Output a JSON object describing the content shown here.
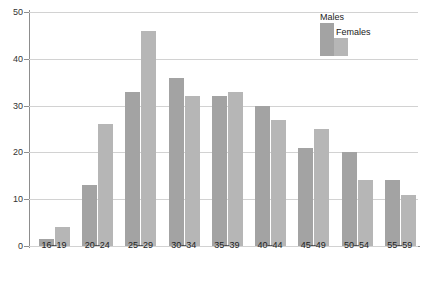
{
  "chart_data": {
    "type": "bar",
    "title": "",
    "subtitle": "",
    "xlabel": "",
    "ylabel": "",
    "categories": [
      "16–19",
      "20–24",
      "25–29",
      "30–34",
      "35–39",
      "40–44",
      "45–49",
      "50–54",
      "55–59"
    ],
    "series": [
      {
        "name": "Males",
        "color": "#a3a3a3",
        "values": [
          1.5,
          13,
          33,
          36,
          32,
          30,
          21,
          20,
          14
        ]
      },
      {
        "name": "Females",
        "color": "#b6b6b6",
        "values": [
          4,
          26,
          46,
          32,
          33,
          27,
          25,
          14,
          11
        ]
      }
    ],
    "ylim": [
      0,
      50
    ],
    "yticks": [
      0,
      10,
      20,
      30,
      40,
      50
    ],
    "ytick_labels": [
      "0",
      "10",
      "20",
      "30",
      "40",
      "50"
    ],
    "grid": "horizontal",
    "legend_position": "top-right"
  },
  "legend": {
    "males_label": "Males",
    "females_label": "Females"
  },
  "colors": {
    "males": "#a3a3a3",
    "females": "#b6b6b6",
    "gridline": "#d2d2d2",
    "axis": "#8d8d8d",
    "text": "#222222",
    "background": "#ffffff"
  }
}
